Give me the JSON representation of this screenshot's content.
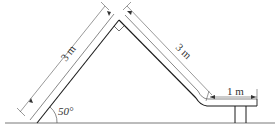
{
  "diagram": {
    "type": "slide-structure",
    "labels": {
      "left_length": "3 m",
      "right_length": "3 m",
      "platform_length": "1 m",
      "angle": "50°"
    },
    "colors": {
      "line": "#1a1a1a",
      "dim_line": "#555555",
      "background": "#ffffff"
    }
  }
}
